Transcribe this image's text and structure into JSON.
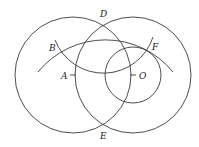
{
  "diagram": {
    "title": "",
    "stroke_color": "#3a3a3a",
    "background": "#ffffff",
    "points": {
      "A": {
        "label": "A",
        "x": 73,
        "y": 75
      },
      "O": {
        "label": "O",
        "x": 133,
        "y": 75
      },
      "D": {
        "label": "D",
        "x": 104,
        "y": 24
      },
      "E": {
        "label": "E",
        "x": 104,
        "y": 126
      },
      "B": {
        "label": "B",
        "x": 59,
        "y": 50
      },
      "F": {
        "label": "F",
        "x": 150,
        "y": 50
      }
    },
    "circles": [
      {
        "name": "circle-center-A",
        "cx": 73,
        "cy": 75,
        "r": 58
      },
      {
        "name": "circle-center-O",
        "cx": 133,
        "cy": 75,
        "r": 58
      },
      {
        "name": "small-circle-center-O",
        "cx": 133,
        "cy": 75,
        "r": 28
      }
    ],
    "arcs": [
      {
        "name": "arc-center-E",
        "center": "E",
        "r": 87,
        "from": [
          38,
          72
        ],
        "to": [
          173,
          72
        ]
      },
      {
        "name": "arc-center-D",
        "center": "D",
        "r": 52,
        "from": [
          55,
          40
        ],
        "to": [
          153,
          37
        ]
      }
    ]
  }
}
